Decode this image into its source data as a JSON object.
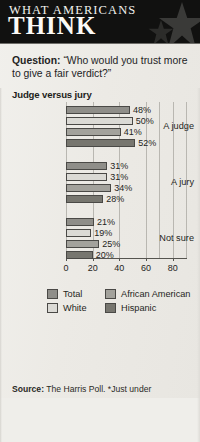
{
  "header": {
    "title_line1": "WHAT AMERICANS",
    "title_line2": "THINK",
    "star_icon": "star-icon"
  },
  "question": {
    "label": "Question:",
    "text": " “Who would you trust more to give a fair verdict?”"
  },
  "subhead": "Judge versus jury",
  "source": {
    "label": "Source:",
    "text": " The Harris Poll. *Just under"
  },
  "legend": {
    "items": [
      {
        "label": "Total",
        "key": "total",
        "color": "#8f8e89"
      },
      {
        "label": "White",
        "key": "white",
        "color": "#dbdad5"
      },
      {
        "label": "African American",
        "key": "afam",
        "color": "#a3a29c"
      },
      {
        "label": "Hispanic",
        "key": "hisp",
        "color": "#77766f"
      }
    ]
  },
  "chart_data": {
    "type": "bar",
    "orientation": "horizontal",
    "title": "Judge versus jury",
    "xlabel": "",
    "ylabel": "",
    "xlim": [
      0,
      90
    ],
    "xticks": [
      0,
      20,
      40,
      60,
      80
    ],
    "grid": true,
    "legend_position": "bottom",
    "categories": [
      "A judge",
      "A jury",
      "Not sure"
    ],
    "series": [
      {
        "name": "Total",
        "values": [
          48,
          31,
          21
        ],
        "labels": [
          "48%",
          "31%",
          "21%"
        ]
      },
      {
        "name": "White",
        "values": [
          50,
          31,
          19
        ],
        "labels": [
          "50%",
          "31%",
          "19%"
        ]
      },
      {
        "name": "African American",
        "values": [
          41,
          34,
          25
        ],
        "labels": [
          "41%",
          "34%",
          "25%"
        ]
      },
      {
        "name": "Hispanic",
        "values": [
          52,
          28,
          20
        ],
        "labels": [
          "52%",
          "28%",
          "20%"
        ]
      }
    ]
  }
}
